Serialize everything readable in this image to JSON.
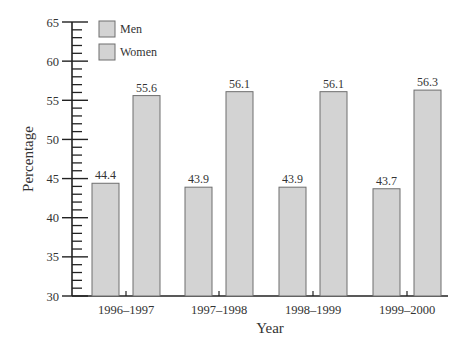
{
  "chart_data": {
    "type": "bar",
    "title": "",
    "xlabel": "Year",
    "ylabel": "Percentage",
    "ylim": [
      30,
      65
    ],
    "yticks": [
      30,
      35,
      40,
      45,
      50,
      55,
      60,
      65
    ],
    "grid": false,
    "legend_position": "top-left",
    "categories": [
      "1996–1997",
      "1997–1998",
      "1998–1999",
      "1999–2000"
    ],
    "series": [
      {
        "name": "Men",
        "values": [
          44.4,
          43.9,
          43.9,
          43.7
        ],
        "color": "#d3d3d3"
      },
      {
        "name": "Women",
        "values": [
          55.6,
          56.1,
          56.1,
          56.3
        ],
        "color": "#d3d3d3"
      }
    ],
    "data_labels": [
      [
        "44.4",
        "43.9",
        "43.9",
        "43.7"
      ],
      [
        "55.6",
        "56.1",
        "56.1",
        "56.3"
      ]
    ]
  },
  "legend": {
    "items": [
      {
        "label": "Men"
      },
      {
        "label": "Women"
      }
    ]
  },
  "colors": {
    "bar_fill": "#d3d3d3",
    "bar_stroke": "#6e6e6e",
    "axis": "#222222",
    "text": "#333333"
  }
}
